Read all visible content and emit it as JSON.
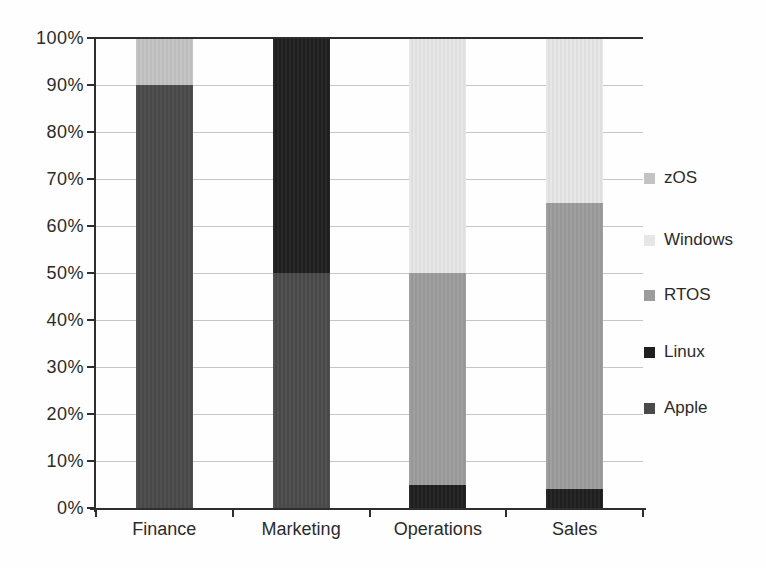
{
  "chart_data": {
    "type": "bar",
    "variant": "stacked-percent",
    "title": "",
    "xlabel": "",
    "ylabel": "",
    "categories": [
      "Finance",
      "Marketing",
      "Operations",
      "Sales"
    ],
    "series": [
      {
        "name": "Apple",
        "color": "#4a4a4a",
        "values": [
          90,
          50,
          0,
          0
        ]
      },
      {
        "name": "Linux",
        "color": "#1f1f1f",
        "values": [
          0,
          50,
          5,
          4
        ]
      },
      {
        "name": "RTOS",
        "color": "#9c9c9c",
        "values": [
          0,
          0,
          45,
          61
        ]
      },
      {
        "name": "Windows",
        "color": "#e6e6e6",
        "values": [
          0,
          0,
          50,
          35
        ]
      },
      {
        "name": "zOS",
        "color": "#c3c3c3",
        "values": [
          10,
          0,
          0,
          0
        ]
      }
    ],
    "legend": {
      "position": "right",
      "entries": [
        "zOS",
        "Windows",
        "RTOS",
        "Linux",
        "Apple"
      ]
    },
    "y_ticks": [
      "100%",
      "90%",
      "80%",
      "70%",
      "60%",
      "50%",
      "40%",
      "30%",
      "20%",
      "10%",
      "0%"
    ],
    "ylim": [
      0,
      100
    ],
    "grid": true,
    "colors": {
      "axis": "#2e2e2e",
      "gridline": "#c6c6c6",
      "text": "#2b2b2b",
      "background": "#fefefe"
    }
  }
}
